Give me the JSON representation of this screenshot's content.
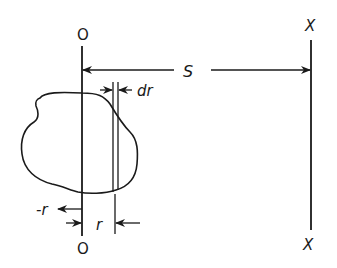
{
  "diagram": {
    "type": "physics-geometry",
    "labels": {
      "axis_o_top": "O",
      "axis_o_bottom": "O",
      "axis_x_top": "X",
      "axis_x_bottom": "X",
      "distance": "S",
      "strip_width": "dr",
      "radius": "r",
      "neg_radius": "-r"
    },
    "colors": {
      "stroke": "#1a1a1a",
      "background": "#ffffff"
    }
  }
}
